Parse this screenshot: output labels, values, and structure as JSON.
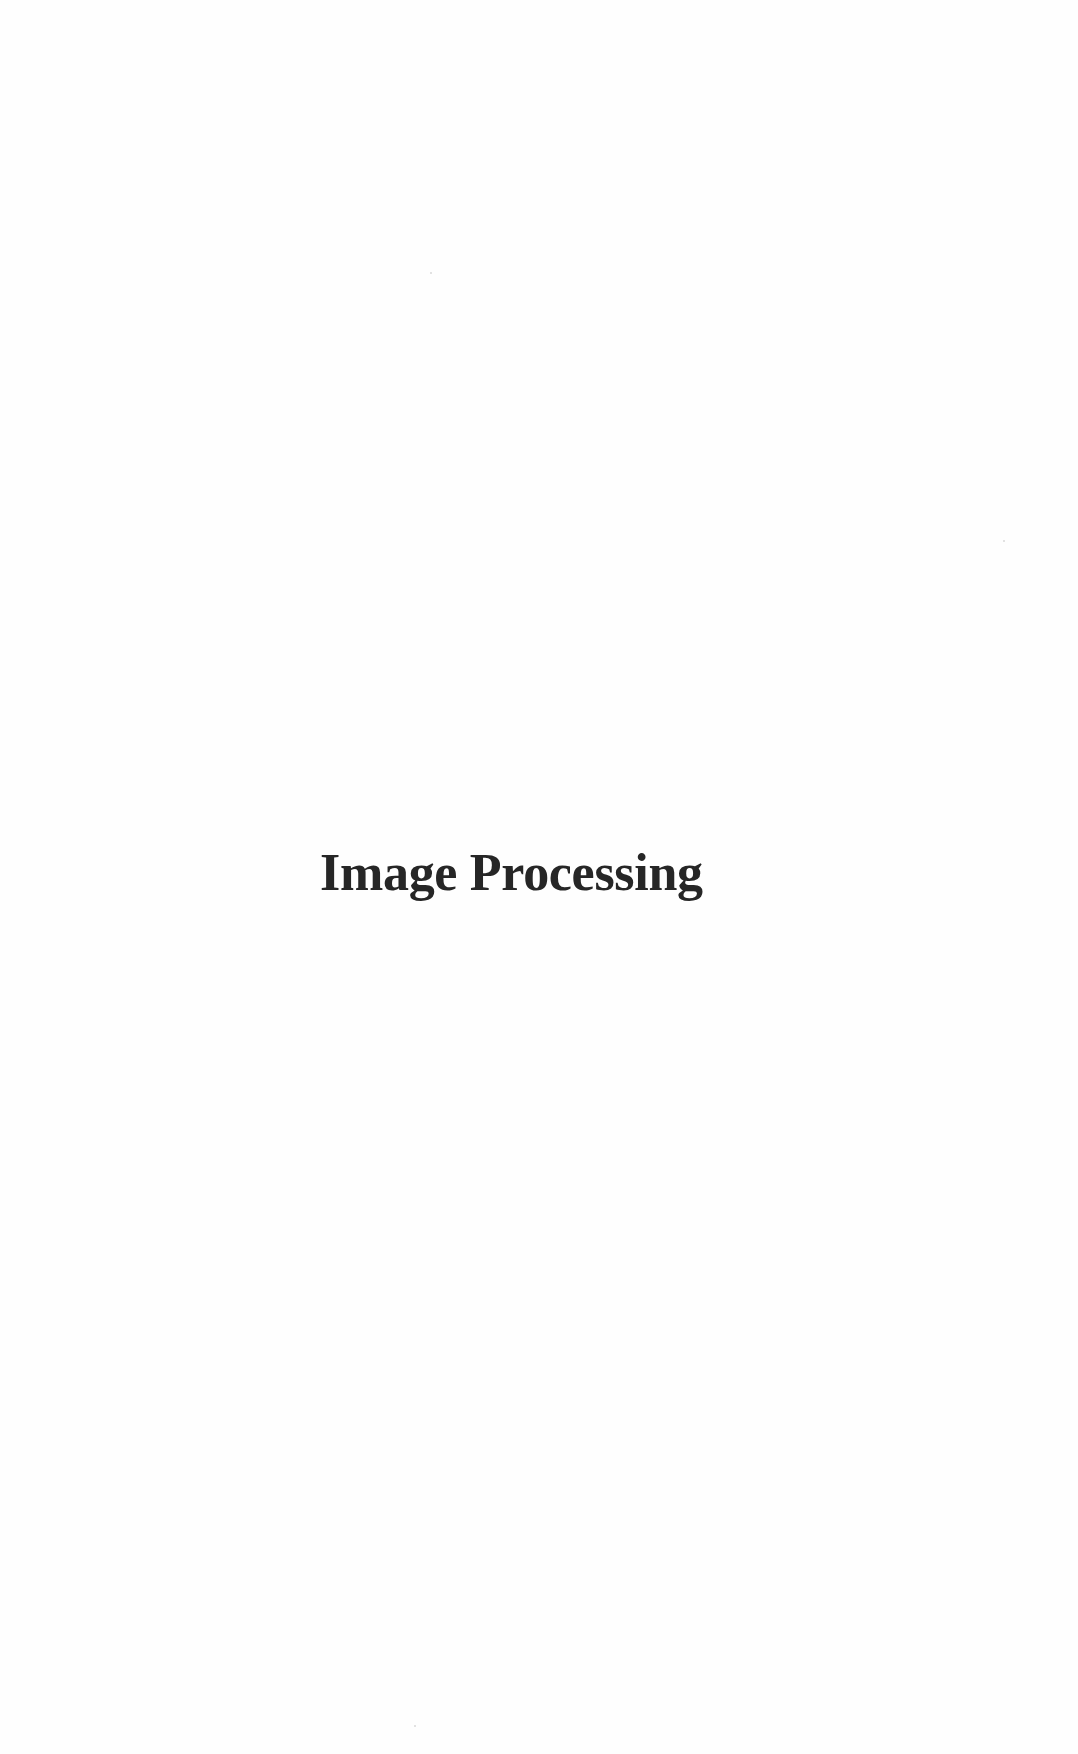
{
  "page": {
    "title": "Image Processing"
  }
}
